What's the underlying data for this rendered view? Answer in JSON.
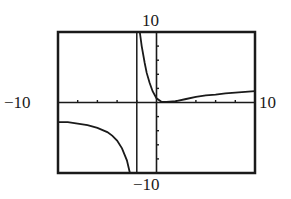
{
  "chart_data": {
    "type": "line",
    "title": "",
    "xlabel": "",
    "ylabel": "",
    "window": {
      "xmin": -10,
      "xmax": 10,
      "ymin": -10,
      "ymax": 10,
      "xscale": 2,
      "yscale": 2
    },
    "window_labels": {
      "ymax": "10",
      "ymin": "−10",
      "xmin": "−10",
      "xmax": "10"
    },
    "grid": false,
    "legend": null,
    "axes": {
      "x_axis": true,
      "y_axis": true,
      "tick_marks": true
    },
    "vertical_asymptote": {
      "x": -2,
      "drawn_as_line": true
    },
    "series": [
      {
        "name": "left branch",
        "points": [
          [
            -10,
            -2.8
          ],
          [
            -9,
            -2.8
          ],
          [
            -8,
            -3.0
          ],
          [
            -7,
            -3.2
          ],
          [
            -6,
            -3.6
          ],
          [
            -5,
            -4.2
          ],
          [
            -4.5,
            -4.7
          ],
          [
            -4,
            -5.4
          ],
          [
            -3.5,
            -6.5
          ],
          [
            -3,
            -8.2
          ],
          [
            -2.7,
            -10
          ]
        ]
      },
      {
        "name": "right branch",
        "points": [
          [
            -1.7,
            10
          ],
          [
            -1.5,
            8.0
          ],
          [
            -1.2,
            5.6
          ],
          [
            -1,
            4.2
          ],
          [
            -0.7,
            2.8
          ],
          [
            -0.4,
            1.6
          ],
          [
            0,
            0.6
          ],
          [
            0.5,
            0.1
          ],
          [
            1,
            0.1
          ],
          [
            2,
            0.2
          ],
          [
            3,
            0.5
          ],
          [
            4,
            0.8
          ],
          [
            5,
            1.0
          ],
          [
            6,
            1.1
          ],
          [
            7,
            1.3
          ],
          [
            8,
            1.4
          ],
          [
            9,
            1.5
          ],
          [
            10,
            1.6
          ]
        ]
      }
    ]
  },
  "colors": {
    "background": "#ffffff",
    "ink": "#1a1a1a"
  }
}
